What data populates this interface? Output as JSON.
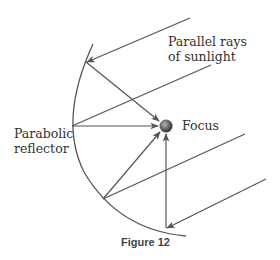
{
  "diagram": {
    "labels": {
      "rays_line1": "Parallel rays",
      "rays_line2": "of sunlight",
      "reflector_line1": "Parabolic",
      "reflector_line2": "reflector",
      "focus": "Focus"
    },
    "caption": "Figure 12",
    "colors": {
      "line": "#555555",
      "focus_dark": "#333333",
      "focus_light": "#9a9a9a"
    },
    "focus_point": [
      166,
      126
    ],
    "incoming_rays": [
      {
        "from": [
          190,
          18
        ],
        "to": [
          86,
          62
        ]
      },
      {
        "from": [
          211,
          65
        ],
        "to": [
          72,
          126
        ]
      },
      {
        "from": [
          245,
          134
        ],
        "to": [
          103,
          199
        ]
      },
      {
        "from": [
          266,
          179
        ],
        "to": [
          166,
          228
        ]
      }
    ],
    "reflected_rays": [
      {
        "from": [
          86,
          62
        ],
        "to": [
          160,
          121
        ]
      },
      {
        "from": [
          72,
          126
        ],
        "to": [
          159,
          126
        ]
      },
      {
        "from": [
          103,
          199
        ],
        "to": [
          161,
          131
        ]
      },
      {
        "from": [
          166,
          228
        ],
        "to": [
          166,
          133
        ]
      }
    ]
  }
}
